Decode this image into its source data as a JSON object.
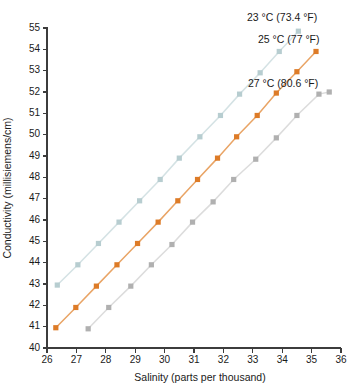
{
  "chart_data": {
    "type": "line",
    "title": "",
    "xlabel": "Salinity (parts per thousand)",
    "ylabel": "Conductivity (millisiemens/cm)",
    "xlim": [
      26,
      36
    ],
    "ylim": [
      40,
      55
    ],
    "xticks": [
      26,
      27,
      28,
      29,
      30,
      31,
      32,
      33,
      34,
      35,
      36
    ],
    "yticks": [
      40,
      41,
      42,
      43,
      44,
      45,
      46,
      47,
      48,
      49,
      50,
      51,
      52,
      53,
      54,
      55
    ],
    "grid": false,
    "legend_position": "inline-right-of-line-ends",
    "series": [
      {
        "name": "23 °C (73.4 °F)",
        "label": "23 °C (73.4 °F)",
        "color": "#c3d6d8",
        "marker_color": "#b7cdd0",
        "line_color": "#d4e2e4",
        "x": [
          26.35,
          27.05,
          27.75,
          28.45,
          29.15,
          29.85,
          30.5,
          31.2,
          31.9,
          32.55,
          33.25,
          33.9,
          34.55
        ],
        "y": [
          42.95,
          43.9,
          44.9,
          45.9,
          46.9,
          47.9,
          48.9,
          49.9,
          50.9,
          51.9,
          52.9,
          53.9,
          54.85
        ]
      },
      {
        "name": "25 °C (77 °F)",
        "label": "25 °C (77 °F)",
        "color": "#e08030",
        "marker_color": "#dd7b27",
        "line_color": "#e9a465",
        "x": [
          26.3,
          26.98,
          27.68,
          28.38,
          29.08,
          29.78,
          30.45,
          31.12,
          31.8,
          32.45,
          33.15,
          33.8,
          34.5,
          35.15
        ],
        "y": [
          40.95,
          41.9,
          42.9,
          43.9,
          44.9,
          45.9,
          46.9,
          47.9,
          48.9,
          49.9,
          50.9,
          51.95,
          52.95,
          53.9
        ]
      },
      {
        "name": "27 °C (80.6 °F)",
        "label": "27 °C (80.6 °F)",
        "color": "#b9b9b9",
        "marker_color": "#b0b0b0",
        "line_color": "#dcdcdc",
        "x": [
          27.4,
          28.1,
          28.85,
          29.55,
          30.25,
          30.95,
          31.65,
          32.35,
          33.1,
          33.8,
          34.5,
          35.25,
          35.6
        ],
        "y": [
          40.9,
          41.9,
          42.9,
          43.9,
          44.85,
          45.9,
          46.85,
          47.9,
          48.85,
          49.85,
          50.9,
          51.9,
          52.0
        ]
      }
    ],
    "annotations": [
      {
        "text": "23 °C (73.4 °F)",
        "x_px": 247,
        "y_px": 13
      },
      {
        "text": "25 °C (77 °F)",
        "x_px": 258,
        "y_px": 35
      },
      {
        "text": "27 °C (80.6 °F)",
        "x_px": 248,
        "y_px": 79
      }
    ]
  }
}
